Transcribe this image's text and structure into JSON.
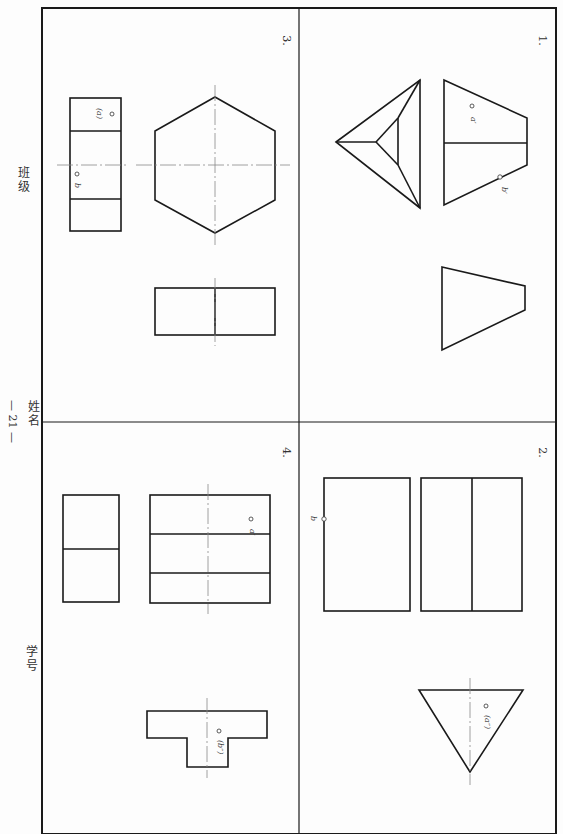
{
  "page": {
    "page_number": "— 21 —",
    "page_number_digits": "21",
    "side_fields": {
      "class_label": "班级",
      "name_label": "姓名",
      "student_id_label": "学号"
    }
  },
  "problems": [
    {
      "id": "problem-1",
      "number": "1.",
      "labels": [
        "a′",
        "b′"
      ],
      "views": [
        "top-view-triangle-pyramid",
        "front-view-trapezoid-split",
        "side-view-trapezoid"
      ]
    },
    {
      "id": "problem-2",
      "number": "2.",
      "labels": [
        "b",
        "(a″)"
      ],
      "views": [
        "rectangle-with-point-b",
        "rectangle-split",
        "inverted-triangle"
      ]
    },
    {
      "id": "problem-3",
      "number": "3.",
      "labels": [
        "(a)",
        "b"
      ],
      "views": [
        "rectangle-three-panel",
        "hexagon",
        "rectangle-split"
      ]
    },
    {
      "id": "problem-4",
      "number": "4.",
      "labels": [
        "a′",
        "(b″)"
      ],
      "views": [
        "rectangle-split-two",
        "rectangle-three-panel-with-centerline",
        "t-shape"
      ]
    }
  ],
  "colors": {
    "line": "#1a1a1a",
    "centerline": "#888888",
    "paper": "#fdfdfd"
  }
}
